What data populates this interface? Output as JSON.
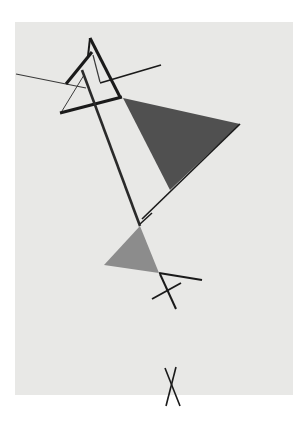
{
  "artwork": {
    "background": "#ffffff",
    "canvas": {
      "x": 15,
      "y": 22,
      "w": 278,
      "h": 373,
      "color": "#e8e8e6"
    },
    "colors": {
      "line": "#1a1a1a",
      "dark_triangle": "#505050",
      "gray_triangle": "#8c8c8c",
      "thin_line": "#3a3a3a"
    },
    "shapes": {
      "dark_triangle": "123,98 240,124 170,190",
      "gray_triangle": "140,226 104,265 159,273"
    }
  }
}
